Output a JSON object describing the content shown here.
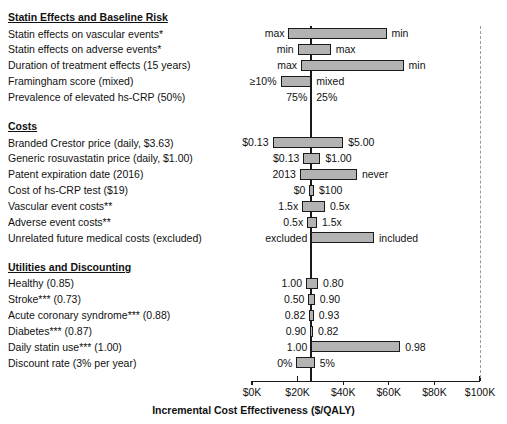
{
  "chart_data": {
    "type": "bar",
    "title": "",
    "xlabel": "Incremental Cost Effectiveness ($/QALY)",
    "ylabel": "",
    "xlim": [
      0,
      100000
    ],
    "xticks": [
      "$0K",
      "$20K",
      "$40K",
      "$60K",
      "$80K",
      "$100K"
    ],
    "xtick_values": [
      0,
      20000,
      40000,
      60000,
      80000,
      100000
    ],
    "baseline_value": 26000,
    "grid": false,
    "legend": "none",
    "orientation": "horizontal-tornado",
    "groups": [
      {
        "heading": "Statin Effects and Baseline Risk",
        "rows": [
          {
            "label": "Statin effects on vascular events*",
            "low_label": "max",
            "high_label": "min",
            "low_value": 16000,
            "high_value": 59000
          },
          {
            "label": "Statin effects on adverse events*",
            "low_label": "min",
            "high_label": "max",
            "low_value": 20000,
            "high_value": 34500
          },
          {
            "label": "Duration of treatment effects (15 years)",
            "low_label": "max",
            "high_label": "min",
            "low_value": 21500,
            "high_value": 66500
          },
          {
            "label": "Framingham score (mixed)",
            "low_label": "≥10%",
            "high_label": "mixed",
            "low_value": 12500,
            "high_value": 26000
          },
          {
            "label": "Prevalence of elevated hs-CRP (50%)",
            "low_label": "75%",
            "high_label": "25%",
            "low_value": 26000,
            "high_value": 26000
          }
        ]
      },
      {
        "heading": "Costs",
        "rows": [
          {
            "label": "Branded Crestor price (daily, $3.63)",
            "low_label": "$0.13",
            "high_label": "$5.00",
            "low_value": 9000,
            "high_value": 40000
          },
          {
            "label": "Generic rosuvastatin price (daily, $1.00)",
            "low_label": "$0.13",
            "high_label": "$1.00",
            "low_value": 22500,
            "high_value": 30000
          },
          {
            "label": "Patent expiration date (2016)",
            "low_label": "2013",
            "high_label": "never",
            "low_value": 21000,
            "high_value": 46000
          },
          {
            "label": "Cost of hs-CRP test ($19)",
            "low_label": "$0",
            "high_label": "$100",
            "low_value": 25200,
            "high_value": 27200
          },
          {
            "label": "Vascular event costs**",
            "low_label": "1.5x",
            "high_label": "0.5x",
            "low_value": 22000,
            "high_value": 32000
          },
          {
            "label": "Adverse event costs**",
            "low_label": "0.5x",
            "high_label": "1.5x",
            "low_value": 24200,
            "high_value": 28500
          },
          {
            "label": "Unrelated future medical costs (excluded)",
            "low_label": "excluded",
            "high_label": "included",
            "low_value": 26000,
            "high_value": 53500
          }
        ]
      },
      {
        "heading": "Utilities and Discounting",
        "rows": [
          {
            "label": "Healthy (0.85)",
            "low_label": "1.00",
            "high_label": "0.80",
            "low_value": 23700,
            "high_value": 29000
          },
          {
            "label": "Stroke*** (0.73)",
            "low_label": "0.50",
            "high_label": "0.90",
            "low_value": 24700,
            "high_value": 27500
          },
          {
            "label": "Acute coronary syndrome*** (0.88)",
            "low_label": "0.82",
            "high_label": "0.93",
            "low_value": 25100,
            "high_value": 27100
          },
          {
            "label": "Diabetes*** (0.87)",
            "low_label": "0.90",
            "high_label": "0.82",
            "low_value": 25500,
            "high_value": 26700
          },
          {
            "label": "Daily statin use*** (1.00)",
            "low_label": "1.00",
            "high_label": "0.98",
            "low_value": 26000,
            "high_value": 65000
          },
          {
            "label": "Discount rate (3% per year)",
            "low_label": "0%",
            "high_label": "5%",
            "low_value": 19500,
            "high_value": 27500
          }
        ]
      }
    ]
  },
  "figure": {
    "axis_title": "Incremental Cost Effectiveness ($/QALY)"
  }
}
